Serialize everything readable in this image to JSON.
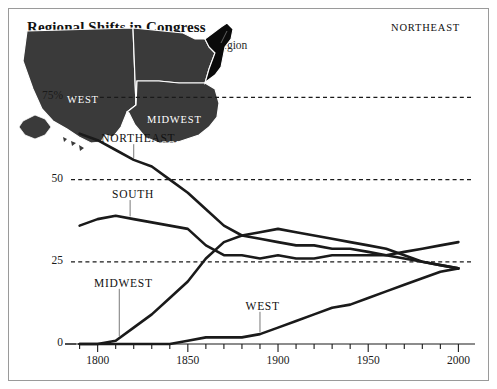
{
  "header": {
    "title": "Regional Shifts in Congress",
    "subtitle": "Percent of House seats representing each region"
  },
  "map": {
    "labels": [
      {
        "name": "northeast",
        "text": "NORTHEAST",
        "style": "dark"
      },
      {
        "name": "west",
        "text": "WEST",
        "style": "light"
      },
      {
        "name": "midwest",
        "text": "MIDWEST",
        "style": "light"
      },
      {
        "name": "south",
        "text": "SOUTH",
        "style": "light"
      }
    ],
    "colors": {
      "land": "#3a3a3a",
      "highlight": "#0a0a0a",
      "border": "#ffffff"
    }
  },
  "chart_data": {
    "type": "line",
    "title": "Regional Shifts in Congress",
    "subtitle": "Percent of House seats representing each region",
    "xlabel": "",
    "ylabel": "",
    "xlim": [
      1788,
      2002
    ],
    "ylim": [
      0,
      80
    ],
    "xticks": [
      1800,
      1850,
      1900,
      1950,
      2000
    ],
    "xtick_labels": [
      "1800",
      "1850",
      "1900",
      "1950",
      "2000"
    ],
    "xminor_step": 10,
    "yticks": [
      0,
      25,
      50,
      75
    ],
    "ytick_labels": [
      "0",
      "25",
      "50",
      "75%"
    ],
    "grid": "dashed-horizontal-at-25-50-75",
    "legend": "inline-labels-with-leader-lines",
    "line_color": "#1a1a1a",
    "series": [
      {
        "name": "NORTHEAST",
        "label_x": 1820,
        "label_y": 62,
        "x": [
          1790,
          1800,
          1810,
          1820,
          1830,
          1840,
          1850,
          1860,
          1870,
          1880,
          1890,
          1900,
          1910,
          1920,
          1930,
          1940,
          1950,
          1960,
          1970,
          1980,
          1990,
          2000
        ],
        "values": [
          64,
          62,
          59,
          56,
          54,
          50,
          46,
          41,
          36,
          33,
          32,
          31,
          30,
          30,
          29,
          29,
          28,
          27,
          26,
          25,
          24,
          23
        ]
      },
      {
        "name": "SOUTH",
        "label_x": 1818,
        "label_y": 45,
        "x": [
          1790,
          1800,
          1810,
          1820,
          1830,
          1840,
          1850,
          1860,
          1870,
          1880,
          1890,
          1900,
          1910,
          1920,
          1930,
          1940,
          1950,
          1960,
          1970,
          1980,
          1990,
          2000
        ],
        "values": [
          36,
          38,
          39,
          38,
          37,
          36,
          35,
          30,
          27,
          27,
          26,
          27,
          26,
          26,
          27,
          27,
          27,
          27,
          28,
          29,
          30,
          31
        ]
      },
      {
        "name": "MIDWEST",
        "label_x": 1812,
        "label_y": 18,
        "x": [
          1790,
          1800,
          1810,
          1820,
          1830,
          1840,
          1850,
          1860,
          1870,
          1880,
          1890,
          1900,
          1910,
          1920,
          1930,
          1940,
          1950,
          1960,
          1970,
          1980,
          1990,
          2000
        ],
        "values": [
          0,
          0,
          1,
          5,
          9,
          14,
          19,
          26,
          31,
          33,
          34,
          35,
          34,
          33,
          32,
          31,
          30,
          29,
          27,
          25,
          24,
          23
        ]
      },
      {
        "name": "WEST",
        "label_x": 1890,
        "label_y": 11,
        "x": [
          1790,
          1800,
          1810,
          1820,
          1830,
          1840,
          1850,
          1860,
          1870,
          1880,
          1890,
          1900,
          1910,
          1920,
          1930,
          1940,
          1950,
          1960,
          1970,
          1980,
          1990,
          2000
        ],
        "values": [
          0,
          0,
          0,
          0,
          0,
          0,
          1,
          2,
          2,
          2,
          3,
          5,
          7,
          9,
          11,
          12,
          14,
          16,
          18,
          20,
          22,
          23
        ]
      }
    ]
  }
}
